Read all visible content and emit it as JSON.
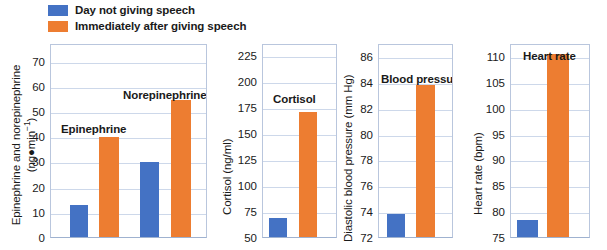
{
  "legend": {
    "items": [
      {
        "label": "Day not giving speech",
        "color": "#4472C4",
        "swatch_name": "legend-swatch-blue"
      },
      {
        "label": "Immediately after giving speech",
        "color": "#ED7D31",
        "swatch_name": "legend-swatch-orange"
      }
    ]
  },
  "colors": {
    "blue": "#4472C4",
    "orange": "#ED7D31",
    "grid": "#cdd8ea",
    "frame": "#b9c6dd",
    "text": "#1a1a1a"
  },
  "chart_data": [
    {
      "type": "bar",
      "title": "",
      "panel_name": "catecholamines",
      "ylabel_line1": "Epinephrine and norepinephrine",
      "ylabel_line2": "(ng●min⁻¹)",
      "ylabel": "Epinephrine and norepinephrine (ng●min⁻¹)",
      "xlabel": "",
      "ylim": [
        0,
        77
      ],
      "yticks": [
        0,
        10,
        20,
        30,
        40,
        50,
        60,
        70
      ],
      "ytick_labels": [
        "0",
        "10",
        "20",
        "30",
        "40",
        "50",
        "60",
        "70"
      ],
      "grid": true,
      "categories": [
        "Epinephrine",
        "Norepinephrine"
      ],
      "annotations": [
        "Epinephrine",
        "Norepinephrine"
      ],
      "series": [
        {
          "name": "Day not giving speech",
          "color": "#4472C4",
          "values": [
            13.6,
            30.6
          ]
        },
        {
          "name": "Immediately after giving speech",
          "color": "#ED7D31",
          "values": [
            40.4,
            55.3
          ]
        }
      ]
    },
    {
      "type": "bar",
      "title": "",
      "panel_name": "cortisol",
      "ylabel": "Cortisol (ng/ml)",
      "xlabel": "",
      "ylim": [
        50,
        237
      ],
      "yticks": [
        50,
        75,
        100,
        125,
        150,
        175,
        200,
        225
      ],
      "ytick_labels": [
        "50",
        "75",
        "100",
        "125",
        "150",
        "175",
        "200",
        "225"
      ],
      "grid": true,
      "categories": [
        "Cortisol"
      ],
      "annotations": [
        "Cortisol"
      ],
      "series": [
        {
          "name": "Day not giving speech",
          "color": "#4472C4",
          "values": [
            70.0
          ]
        },
        {
          "name": "Immediately after giving speech",
          "color": "#ED7D31",
          "values": [
            172.5
          ]
        }
      ]
    },
    {
      "type": "bar",
      "title": "",
      "panel_name": "blood-pressure",
      "ylabel": "Diastolic blood pressure (mm Hg)",
      "xlabel": "",
      "ylim": [
        72,
        87
      ],
      "yticks": [
        72,
        74,
        76,
        78,
        80,
        82,
        84,
        86
      ],
      "ytick_labels": [
        "72",
        "74",
        "76",
        "78",
        "80",
        "82",
        "84",
        "86"
      ],
      "grid": true,
      "categories": [
        "Blood pressure"
      ],
      "annotations": [
        "Blood pressure"
      ],
      "series": [
        {
          "name": "Day not giving speech",
          "color": "#4472C4",
          "values": [
            73.9
          ]
        },
        {
          "name": "Immediately after giving speech",
          "color": "#ED7D31",
          "values": [
            83.9
          ]
        }
      ]
    },
    {
      "type": "bar",
      "title": "",
      "panel_name": "heart-rate",
      "ylabel": "Heart rate (bpm)",
      "xlabel": "",
      "ylim": [
        75,
        112.5
      ],
      "yticks": [
        75,
        80,
        85,
        90,
        95,
        100,
        105,
        110
      ],
      "ytick_labels": [
        "75",
        "80",
        "85",
        "90",
        "95",
        "100",
        "105",
        "110"
      ],
      "grid": true,
      "categories": [
        "Heart rate"
      ],
      "annotations": [
        "Heart rate"
      ],
      "series": [
        {
          "name": "Day not giving speech",
          "color": "#4472C4",
          "values": [
            78.7
          ]
        },
        {
          "name": "Immediately after giving speech",
          "color": "#ED7D31",
          "values": [
            110.8
          ]
        }
      ]
    }
  ]
}
